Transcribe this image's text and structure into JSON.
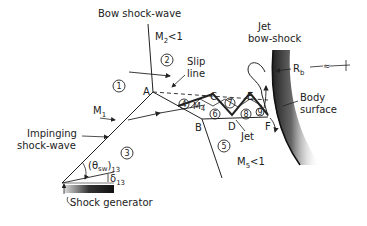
{
  "labels": {
    "bow_shock": "Bow shock-wave",
    "m2": "M",
    "m2_sub": "2",
    "m2_rel": "<1",
    "slip_line_1": "Slip",
    "slip_line_2": "line",
    "jet_bow_shock_1": "Jet",
    "jet_bow_shock_2": "bow-shock",
    "rb": "R",
    "rb_sub": "b",
    "body_surface_1": "Body",
    "body_surface_2": "surface",
    "m1": "M",
    "m1_sub": "1",
    "impinging_1": "Impinging",
    "impinging_2": "shock-wave",
    "theta": "(θ",
    "theta_sub": "sw",
    "theta_close": ")",
    "theta_idx": "13",
    "delta": "δ",
    "delta_idx": "13",
    "shock_generator": "Shock generator",
    "jet": "Jet",
    "m5": "M",
    "m5_sub": "5",
    "m5_rel": "<1",
    "m4": "M",
    "m4_sub": "4",
    "point_a": "A",
    "point_b": "B",
    "point_c": "C",
    "point_d": "D",
    "point_e": "E",
    "point_f": "F"
  },
  "regions": [
    "1",
    "2",
    "3",
    "4",
    "5",
    "6",
    "7",
    "8",
    "9"
  ]
}
